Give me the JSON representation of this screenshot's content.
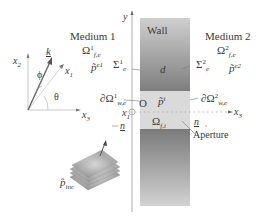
{
  "diagram": {
    "wall": {
      "label": "Wall",
      "thickness_label": "d"
    },
    "medium1": {
      "title": "Medium 1",
      "domain_base": "Ω",
      "domain_sup": "1",
      "domain_sub": "f,e",
      "interface_base": "Σ",
      "interface_sup": "1",
      "interface_sub": "e",
      "pressure_base": "p̃",
      "pressure_sup": "e1",
      "boundary_base": "∂Ω",
      "boundary_sup": "1",
      "boundary_sub": "w,e"
    },
    "medium2": {
      "title": "Medium 2",
      "domain_base": "Ω",
      "domain_sup": "2",
      "domain_sub": "f,e",
      "interface_base": "Σ",
      "interface_sup": "2",
      "interface_sub": "e",
      "pressure_base": "p̃",
      "pressure_sup": "e2",
      "boundary_base": "∂Ω",
      "boundary_sup": "2",
      "boundary_sub": "w,e"
    },
    "aperture": {
      "label": "Aperture",
      "domain_base": "Ω",
      "domain_sub": "f,i",
      "pressure_base": "p̃",
      "pressure_sup": "i",
      "origin": "O",
      "normal_left": "n",
      "normal_right": "n"
    },
    "axes": {
      "y": "y",
      "x1": "x",
      "x1_sub": "1",
      "x2": "x",
      "x2_sub": "2",
      "x3": "x",
      "x3_sub": "3",
      "x3_main": "x",
      "x3_main_sub": "3",
      "x1_main": "x",
      "x1_main_sub": "1"
    },
    "wave": {
      "k": "k",
      "phi": "ϕ",
      "theta": "θ",
      "incident_base": "p̂",
      "incident_sub": "inc"
    },
    "colors": {
      "wall_light": "#c9c9c9",
      "wall_dark": "#7a7a7a",
      "aperture": "#dcdcdc",
      "text": "#3a3a3a"
    }
  }
}
